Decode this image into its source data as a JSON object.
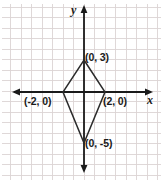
{
  "figure": {
    "name": "coordinate-plane-kite-figure",
    "width": 163,
    "height": 184,
    "background_color": "#ffffff"
  },
  "axes": {
    "x_label": "x",
    "y_label": "y",
    "axis_color": "#1a1a1a",
    "grid_color": "#dcd4d4",
    "grid_visible": true,
    "grid_spacing_px": 10.5,
    "origin_px": {
      "x": 84,
      "y": 92
    },
    "x_axis_px": {
      "x1": 13,
      "x2": 152,
      "y": 92
    },
    "y_axis_px": {
      "y1": 6,
      "y2": 172,
      "x": 84
    },
    "arrows": [
      "x-left",
      "x-right",
      "y-up",
      "y-down"
    ]
  },
  "shape": {
    "type": "kite",
    "stroke_color": "#2b2b2b",
    "fill": "none",
    "vertices": [
      {
        "label": "(0, 3)",
        "x": 0,
        "y": 3,
        "px_x": 84,
        "px_y": 60
      },
      {
        "label": "(2, 0)",
        "x": 2,
        "y": 0,
        "px_x": 105,
        "px_y": 92
      },
      {
        "label": "(0, -5)",
        "x": 0,
        "y": -5,
        "px_x": 84,
        "px_y": 143
      },
      {
        "label": "(-2, 0)",
        "x": -2,
        "y": 0,
        "px_x": 63,
        "px_y": 92
      }
    ]
  },
  "chart_data": {
    "type": "scatter",
    "title": "",
    "xlabel": "x",
    "ylabel": "y",
    "xlim": [
      -8,
      6.5
    ],
    "ylim": [
      -7.6,
      8.2
    ],
    "grid": true,
    "legend": null,
    "annotations": [
      "(0, 3)",
      "(2, 0)",
      "(0, -5)",
      "(-2, 0)"
    ],
    "series": [
      {
        "name": "kite",
        "closed": true,
        "x": [
          0,
          2,
          0,
          -2
        ],
        "y": [
          3,
          0,
          -5,
          0
        ]
      }
    ]
  }
}
